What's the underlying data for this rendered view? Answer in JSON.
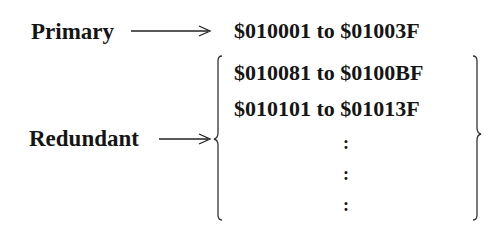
{
  "diagram": {
    "primary": {
      "label": "Primary",
      "range": "$010001 to $01003F"
    },
    "redundant": {
      "label": "Redundant",
      "ranges": [
        "$010081 to $0100BF",
        "$010101 to $01013F"
      ],
      "continuation": [
        ":",
        ":",
        ":"
      ]
    }
  }
}
